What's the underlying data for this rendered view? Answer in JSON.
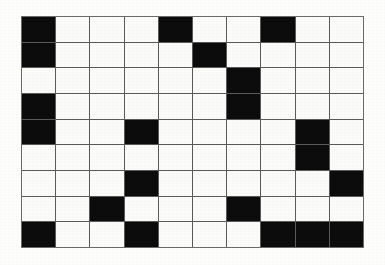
{
  "puzzle": {
    "type": "crossword-grid",
    "title": "Crossword Puzzle Grid",
    "rows": 9,
    "columns": 10,
    "colors": {
      "block": "#0c0c0c",
      "open": "#fbfbfa",
      "gridline": "#5a5a5a",
      "page": "#fdfdfc"
    },
    "legend": {
      "block_label": "blocked square",
      "open_label": "open square"
    },
    "grid": [
      [
        1,
        0,
        0,
        0,
        1,
        0,
        0,
        1,
        0,
        0
      ],
      [
        1,
        0,
        0,
        0,
        0,
        1,
        0,
        0,
        0,
        0
      ],
      [
        0,
        0,
        0,
        0,
        0,
        0,
        1,
        0,
        0,
        0
      ],
      [
        1,
        0,
        0,
        0,
        0,
        0,
        1,
        0,
        0,
        0
      ],
      [
        1,
        0,
        0,
        1,
        0,
        0,
        0,
        0,
        1,
        0
      ],
      [
        0,
        0,
        0,
        0,
        0,
        0,
        0,
        0,
        1,
        0
      ],
      [
        0,
        0,
        0,
        1,
        0,
        0,
        0,
        0,
        0,
        1
      ],
      [
        0,
        0,
        1,
        0,
        0,
        0,
        1,
        0,
        0,
        0
      ],
      [
        1,
        0,
        0,
        1,
        0,
        0,
        0,
        1,
        1,
        1
      ]
    ],
    "block_count": 24,
    "open_count": 66
  }
}
